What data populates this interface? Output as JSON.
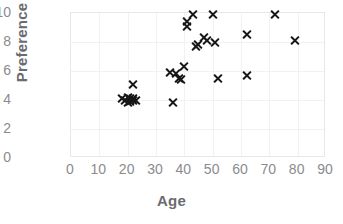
{
  "chart_data": {
    "type": "scatter",
    "title": "",
    "xlabel": "Age",
    "ylabel": "Preference",
    "xlim": [
      0,
      90
    ],
    "ylim": [
      0,
      10
    ],
    "xticks": [
      0,
      10,
      20,
      30,
      40,
      50,
      60,
      70,
      80,
      90
    ],
    "yticks": [
      0,
      2,
      4,
      6,
      8,
      10
    ],
    "grid": true,
    "legend": "none",
    "marker": "x",
    "marker_color": "#171717",
    "series": [
      {
        "name": "Age vs Preference",
        "points": [
          [
            18,
            4.1
          ],
          [
            19,
            4.0
          ],
          [
            20,
            4.2
          ],
          [
            20,
            3.8
          ],
          [
            21,
            4.1
          ],
          [
            21,
            3.9
          ],
          [
            22,
            4.1
          ],
          [
            22,
            4.0
          ],
          [
            22,
            5.1
          ],
          [
            23,
            4.0
          ],
          [
            35,
            5.9
          ],
          [
            36,
            3.8
          ],
          [
            37,
            5.8
          ],
          [
            38,
            5.5
          ],
          [
            39,
            5.4
          ],
          [
            40,
            6.3
          ],
          [
            41,
            9.1
          ],
          [
            41,
            9.4
          ],
          [
            43,
            9.9
          ],
          [
            44,
            7.7
          ],
          [
            45,
            7.8
          ],
          [
            47,
            8.3
          ],
          [
            48,
            8.1
          ],
          [
            50,
            9.9
          ],
          [
            51,
            8.0
          ],
          [
            52,
            5.5
          ],
          [
            62,
            8.5
          ],
          [
            62,
            5.7
          ],
          [
            72,
            9.9
          ],
          [
            79,
            8.1
          ]
        ]
      }
    ]
  },
  "axis": {
    "x_title": "Age",
    "y_title": "Preference"
  }
}
